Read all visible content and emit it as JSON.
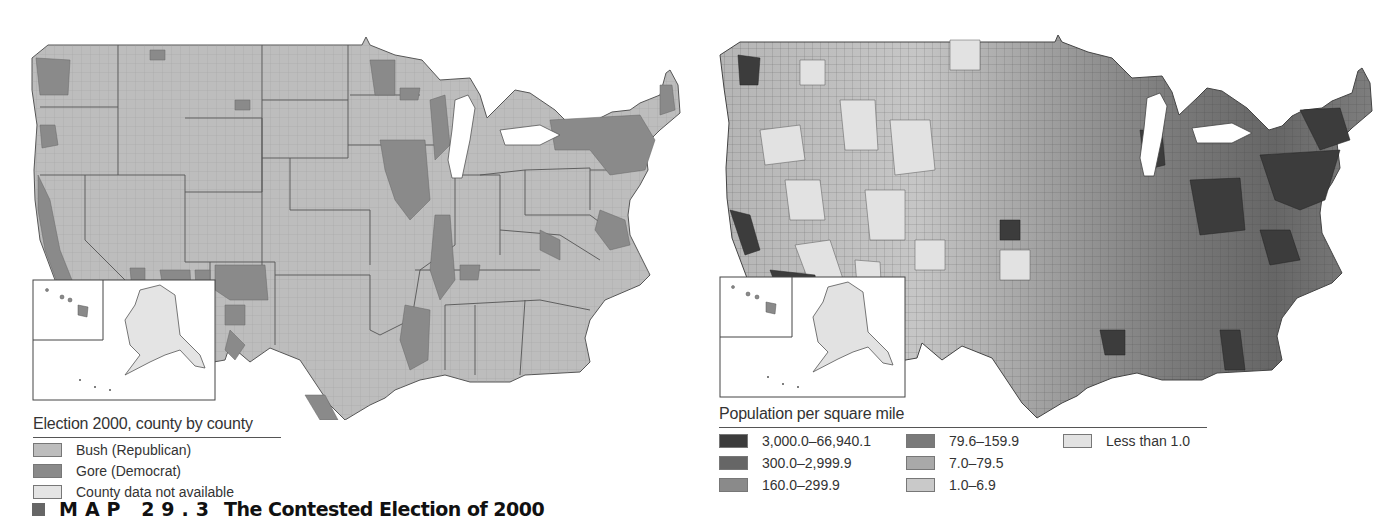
{
  "caption": {
    "label": "MAP 29.3",
    "title": "The Contested Election of 2000"
  },
  "left_map": {
    "legend_title": "Election 2000, county by county",
    "legend": [
      {
        "label": "Bush (Republican)",
        "color": "#bdbdbd"
      },
      {
        "label": "Gore (Democrat)",
        "color": "#8a8a8a"
      },
      {
        "label": "County data not available",
        "color": "#e4e4e4"
      }
    ]
  },
  "right_map": {
    "legend_title": "Population per square mile",
    "legend": [
      {
        "label": "3,000.0–66,940.1",
        "color": "#3c3c3c"
      },
      {
        "label": "300.0–2,999.9",
        "color": "#666666"
      },
      {
        "label": "160.0–299.9",
        "color": "#8a8a8a"
      },
      {
        "label": "79.6–159.9",
        "color": "#7a7a7a"
      },
      {
        "label": "7.0–79.5",
        "color": "#a9a9a9"
      },
      {
        "label": "1.0–6.9",
        "color": "#c9c9c9"
      },
      {
        "label": "Less than 1.0",
        "color": "#e2e2e2"
      }
    ]
  }
}
